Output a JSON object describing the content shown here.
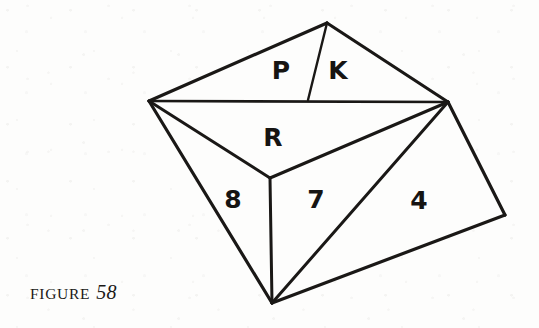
{
  "figure": {
    "caption_word": "FIGURE",
    "caption_number": "58",
    "line_color": "#1a1816",
    "background_color": "#fdfdfc",
    "label_color": "#161412"
  },
  "diagram": {
    "kind": "line-drawing",
    "vertices": {
      "apex": {
        "x": 327,
        "y": 23
      },
      "left": {
        "x": 149,
        "y": 101
      },
      "right": {
        "x": 448,
        "y": 102
      },
      "center": {
        "x": 270,
        "y": 178
      },
      "bottom": {
        "x": 272,
        "y": 303
      },
      "far_right": {
        "x": 505,
        "y": 215
      },
      "divider_foot": {
        "x": 308,
        "y": 100
      }
    },
    "faces": [
      {
        "name": "face-p",
        "label": "P",
        "label_x": 281,
        "label_y": 70,
        "points": "327,23 149,101 308,100"
      },
      {
        "name": "face-k",
        "label": "K",
        "label_x": 338,
        "label_y": 70,
        "points": "327,23 308,100 448,102"
      },
      {
        "name": "face-r",
        "label": "R",
        "label_x": 273,
        "label_y": 137,
        "points": "149,101 448,102 270,178"
      },
      {
        "name": "face-8",
        "label": "8",
        "label_x": 233,
        "label_y": 199,
        "points": "149,101 270,178 272,303"
      },
      {
        "name": "face-7",
        "label": "7",
        "label_x": 316,
        "label_y": 199,
        "points": "270,178 448,102 272,303"
      },
      {
        "name": "face-4",
        "label": "4",
        "label_x": 419,
        "label_y": 200,
        "points": "448,102 505,215 272,303"
      }
    ],
    "edges": [
      {
        "name": "edge-apex-left",
        "x1": 327,
        "y1": 23,
        "x2": 149,
        "y2": 101,
        "width": 3.2
      },
      {
        "name": "edge-apex-right",
        "x1": 327,
        "y1": 23,
        "x2": 448,
        "y2": 102,
        "width": 3.2
      },
      {
        "name": "edge-pk-divider",
        "x1": 327,
        "y1": 23,
        "x2": 308,
        "y2": 100,
        "width": 2.4
      },
      {
        "name": "edge-left-right",
        "x1": 149,
        "y1": 101,
        "x2": 448,
        "y2": 102,
        "width": 2.6
      },
      {
        "name": "edge-left-center",
        "x1": 149,
        "y1": 101,
        "x2": 270,
        "y2": 178,
        "width": 3.0
      },
      {
        "name": "edge-right-center",
        "x1": 448,
        "y1": 102,
        "x2": 270,
        "y2": 178,
        "width": 3.0
      },
      {
        "name": "edge-left-bottom",
        "x1": 149,
        "y1": 101,
        "x2": 272,
        "y2": 303,
        "width": 3.2
      },
      {
        "name": "edge-center-bottom",
        "x1": 270,
        "y1": 178,
        "x2": 272,
        "y2": 303,
        "width": 3.0
      },
      {
        "name": "edge-right-bottom",
        "x1": 448,
        "y1": 102,
        "x2": 272,
        "y2": 303,
        "width": 3.0
      },
      {
        "name": "edge-right-farright",
        "x1": 448,
        "y1": 102,
        "x2": 505,
        "y2": 215,
        "width": 3.2
      },
      {
        "name": "edge-farright-bottom",
        "x1": 505,
        "y1": 215,
        "x2": 272,
        "y2": 303,
        "width": 3.2
      }
    ]
  }
}
